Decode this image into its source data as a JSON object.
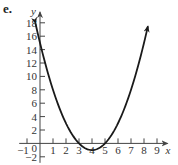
{
  "figure_label": "e.",
  "chart_data": {
    "type": "line",
    "title": "",
    "xlabel": "x",
    "ylabel": "y",
    "xlim": [
      -1,
      9.5
    ],
    "ylim": [
      -2,
      19
    ],
    "x_ticks": [
      -1,
      1,
      2,
      3,
      4,
      5,
      6,
      7,
      8,
      9
    ],
    "x_tick_labels": [
      "−1",
      "1",
      "2",
      "3",
      "4",
      "5",
      "6",
      "7",
      "8",
      "9"
    ],
    "y_ticks": [
      -2,
      2,
      4,
      6,
      8,
      10,
      12,
      14,
      16,
      18
    ],
    "y_tick_labels": [
      "−2",
      "2",
      "4",
      "6",
      "8",
      "10",
      "12",
      "14",
      "16",
      "18"
    ],
    "origin_label": "0",
    "grid": false,
    "series": [
      {
        "name": "y = (x − 3)(x − 5)",
        "equation": "y = x^2 - 8x + 15",
        "x_range": [
          -0.35,
          8.3
        ],
        "vertex": [
          4,
          -1
        ],
        "roots": [
          3,
          5
        ],
        "y_intercept": 15,
        "arrows_both_ends": true,
        "color": "#1a1a1a"
      }
    ]
  }
}
